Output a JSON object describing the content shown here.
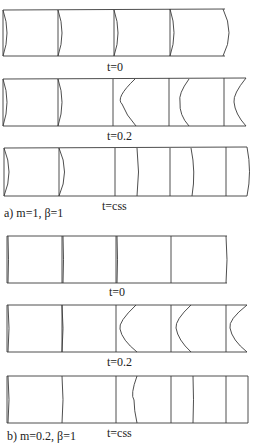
{
  "figure": {
    "panels": [
      {
        "id": "a-t0",
        "group": "a",
        "time_label": "t=0",
        "front_shape": "convex",
        "cells": 4
      },
      {
        "id": "a-t02",
        "group": "a",
        "time_label": "t=0.2",
        "front_shape": "concave-wave",
        "cells": 5
      },
      {
        "id": "a-tcss",
        "group": "a",
        "time_label": "t=css",
        "front_shape": "flattened",
        "cells": 7
      },
      {
        "id": "b-t0",
        "group": "b",
        "time_label": "t=0",
        "front_shape": "flat",
        "cells": 4
      },
      {
        "id": "b-t02",
        "group": "b",
        "time_label": "t=0.2",
        "front_shape": "concave-wave",
        "cells": 5
      },
      {
        "id": "b-tcss",
        "group": "b",
        "time_label": "t=css",
        "front_shape": "flattened",
        "cells": 7
      }
    ],
    "captions": {
      "a": "a) m=1, β=1",
      "b": "b) m=0.2, β=1"
    }
  }
}
